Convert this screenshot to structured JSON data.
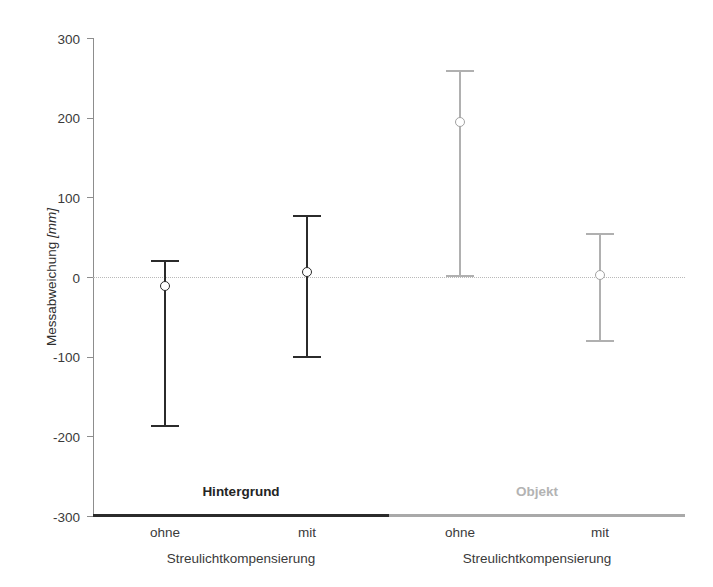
{
  "chart_data": {
    "type": "scatter",
    "title": "",
    "xlabel": "Streulichtkompensierung",
    "ylabel": "Messabweichung",
    "ylabel_unit": "[mm]",
    "ylim": [
      -300,
      300
    ],
    "yticks": [
      300,
      200,
      100,
      0,
      -100,
      -200,
      -300
    ],
    "ytick_labels": [
      "300",
      "200",
      "100",
      "0",
      "-100",
      "-200",
      "-300"
    ],
    "grid": false,
    "zero_reference_line": true,
    "legend_position": "none",
    "groups": [
      {
        "name": "Hintergrund",
        "color": "#2b2b2b",
        "axis_label": "Streulichtkompensierung",
        "points": [
          {
            "category": "ohne",
            "mean": -11,
            "upper": 21,
            "lower": -188
          },
          {
            "category": "mit",
            "mean": 6,
            "upper": 78,
            "lower": -102
          }
        ]
      },
      {
        "name": "Objekt",
        "color": "#b0b0b0",
        "axis_label": "Streulichtkompensierung",
        "points": [
          {
            "category": "ohne",
            "mean": 194,
            "upper": 260,
            "lower": 0
          },
          {
            "category": "mit",
            "mean": 3,
            "upper": 55,
            "lower": -82
          }
        ]
      }
    ]
  },
  "axes": {
    "y_title_main": "Messabweichung",
    "y_title_unit": "[mm]"
  },
  "group_captions": [
    {
      "label": "Hintergrund",
      "tone": "dark"
    },
    {
      "label": "Objekt",
      "tone": "light"
    }
  ],
  "x_tick_labels": [
    "ohne",
    "mit",
    "ohne",
    "mit"
  ],
  "x_group_labels": [
    "Streulichtkompensierung",
    "Streulichtkompensierung"
  ]
}
